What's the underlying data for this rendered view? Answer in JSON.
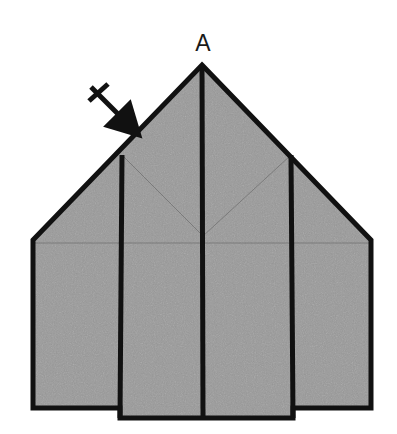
{
  "figure": {
    "type": "origami-fold-step",
    "canvas": {
      "width": 397,
      "height": 434,
      "background": "#ffffff"
    },
    "colors": {
      "paper_fill": "#999999",
      "outline": "#111111",
      "fold_line": "#6f6f6f",
      "label": "#1a1a1a",
      "arrow": "#111111"
    },
    "labels": {
      "apex_point": "A"
    },
    "annotations": {
      "fold_arrow": {
        "name": "fold-direction-arrow",
        "description": "arrow pointing down-right toward the left roof edge",
        "cross_mark": "x",
        "start_x": 90,
        "start_y": 86,
        "end_x": 127,
        "end_y": 122
      }
    },
    "geometry": {
      "outer_outline_points": "202,65 371,240 371,408 293,408 293,418 120,418 120,408 33,408 33,240",
      "panels": [
        {
          "name": "left-panel",
          "points": "33,240 122,155 122,408 33,408"
        },
        {
          "name": "left-center-panel",
          "points": "122,155 202,65 202,418 120,418"
        },
        {
          "name": "right-center-panel",
          "points": "202,65 291,155 293,418 202,418"
        },
        {
          "name": "right-panel",
          "points": "291,155 371,240 371,408 293,408"
        }
      ],
      "fold_lines": [
        {
          "name": "vertical-fold-left",
          "x1": 122,
          "y1": 155,
          "x2": 120,
          "y2": 418,
          "weight": "heavy"
        },
        {
          "name": "vertical-fold-center",
          "x1": 202,
          "y1": 65,
          "x2": 203,
          "y2": 418,
          "weight": "heavy"
        },
        {
          "name": "vertical-fold-right",
          "x1": 291,
          "y1": 155,
          "x2": 293,
          "y2": 418,
          "weight": "heavy"
        },
        {
          "name": "v-fold-left-arm",
          "x1": 122,
          "y1": 155,
          "x2": 203,
          "y2": 236,
          "weight": "light"
        },
        {
          "name": "v-fold-right-arm",
          "x1": 291,
          "y1": 155,
          "x2": 203,
          "y2": 236,
          "weight": "light"
        },
        {
          "name": "horizontal-fold",
          "x1": 33,
          "y1": 243,
          "x2": 371,
          "y2": 243,
          "weight": "light"
        }
      ],
      "label_positions": {
        "apex_label": {
          "x": 203,
          "y": 51
        }
      }
    }
  }
}
